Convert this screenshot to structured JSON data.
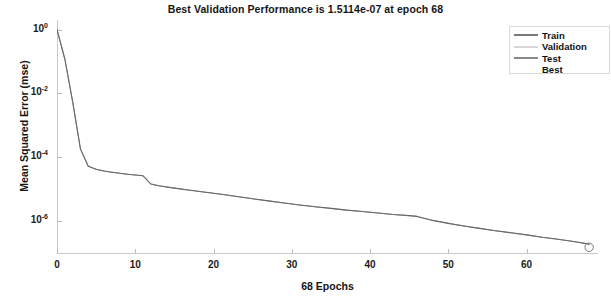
{
  "chart_data": {
    "type": "line",
    "title": "Best Validation Performance is 1.5114e-07 at epoch 68",
    "xlabel": "68 Epochs",
    "ylabel": "Mean Squared Error  (mse)",
    "yscale": "log",
    "xlim": [
      0,
      69
    ],
    "ylim": [
      1e-07,
      2.0
    ],
    "grid": false,
    "legend_position": "top-right",
    "xticks": [
      0,
      10,
      20,
      30,
      40,
      50,
      60
    ],
    "xtick_labels": [
      "0",
      "10",
      "20",
      "30",
      "40",
      "50",
      "60"
    ],
    "yticks": [
      1,
      0.01,
      0.0001,
      1e-06
    ],
    "ytick_labels": [
      "10",
      "10",
      "10",
      "10"
    ],
    "ytick_exponents": [
      "0",
      "-2",
      "-4",
      "-6"
    ],
    "best_epoch": 68,
    "best_value": "1.5114e-07",
    "series": [
      {
        "name": "Train",
        "color": "#4a4a4a",
        "x": [
          0,
          1,
          2,
          3,
          4,
          5,
          6,
          7,
          8,
          9,
          10,
          11,
          12,
          13,
          15,
          17,
          19,
          21,
          23,
          25,
          27,
          29,
          31,
          33,
          35,
          37,
          39,
          41,
          43,
          45,
          46,
          48,
          50,
          52,
          54,
          56,
          58,
          60,
          62,
          64,
          66,
          68
        ],
        "y": [
          1.0,
          0.12,
          0.0055,
          0.00018,
          5.2e-05,
          4.2e-05,
          3.7e-05,
          3.4e-05,
          3.15e-05,
          2.95e-05,
          2.78e-05,
          2.62e-05,
          1.45e-05,
          1.28e-05,
          1.08e-05,
          9.3e-06,
          8e-06,
          6.9e-06,
          5.9e-06,
          5e-06,
          4.3e-06,
          3.7e-06,
          3.2e-06,
          2.8e-06,
          2.5e-06,
          2.2e-06,
          2e-06,
          1.8e-06,
          1.6e-06,
          1.48e-06,
          1.4e-06,
          1.05e-06,
          8.5e-07,
          7e-07,
          5.9e-07,
          5e-07,
          4.3e-07,
          3.7e-07,
          3.1e-07,
          2.7e-07,
          2.3e-07,
          1.9e-07
        ]
      },
      {
        "name": "Validation",
        "color": "#8d8d8d",
        "x": [
          0,
          68
        ],
        "y": [
          1.0,
          1.5114e-07
        ]
      },
      {
        "name": "Test",
        "color": "#6f6f6f",
        "x": [
          0,
          68
        ],
        "y": [
          1.0,
          1.7e-07
        ]
      }
    ],
    "best_marker": {
      "name": "Best",
      "x": 68,
      "y": 1.5114e-07,
      "shape": "circle",
      "color": "#7a7a7a"
    }
  },
  "legend": {
    "items": [
      {
        "label": "Train",
        "color": "#6a6a6a",
        "style": "line"
      },
      {
        "label": "Validation",
        "color": "#b0b0b0",
        "style": "line"
      },
      {
        "label": "Test",
        "color": "#7d7d7d",
        "style": "line"
      },
      {
        "label": "Best",
        "color": "#9a9a9a",
        "style": "none"
      }
    ]
  }
}
